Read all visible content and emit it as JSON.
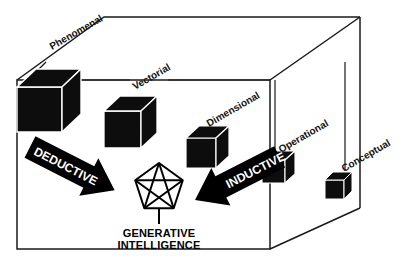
{
  "diagram": {
    "title_visible": false,
    "background_color": "#ffffff",
    "line_color": "#1a1a1a",
    "cube_fill": "#0d0d0d",
    "arrow_fill": "#000000",
    "arrow_text_color": "#ffffff",
    "axis_labels": [
      {
        "id": "phenomenal",
        "text": "Phenomenal",
        "x": 52,
        "y": 50,
        "rotation": -30,
        "font_size": 10
      },
      {
        "id": "vectorial",
        "text": "Vectorial",
        "x": 135,
        "y": 90,
        "rotation": -30,
        "font_size": 10
      },
      {
        "id": "dimensional",
        "text": "Dimensional",
        "x": 209,
        "y": 127,
        "rotation": -30,
        "font_size": 10
      },
      {
        "id": "operational",
        "text": "Operational",
        "x": 278,
        "y": 152,
        "rotation": -30,
        "font_size": 10
      },
      {
        "id": "conceptual",
        "text": "Conceptual",
        "x": 340,
        "y": 170,
        "rotation": -30,
        "font_size": 10
      }
    ],
    "cubes": [
      {
        "id": "cube-phenomenal",
        "label_ref": "phenomenal",
        "x": 17,
        "y": 69,
        "size": 52
      },
      {
        "id": "cube-vectorial",
        "label_ref": "vectorial",
        "x": 104,
        "y": 96,
        "size": 43
      },
      {
        "id": "cube-dimensional",
        "label_ref": "dimensional",
        "x": 186,
        "y": 126,
        "size": 34
      },
      {
        "id": "cube-operational",
        "label_ref": "operational",
        "x": 262,
        "y": 151,
        "size": 27
      },
      {
        "id": "cube-conceptual",
        "label_ref": "conceptual",
        "x": 325,
        "y": 172,
        "size": 22
      }
    ],
    "arrows": [
      {
        "id": "deductive",
        "text": "DEDUCTIVE",
        "direction": "down-right",
        "angle": 27,
        "font_size": 12
      },
      {
        "id": "inductive",
        "text": "INDUCTIVE",
        "direction": "up-left",
        "angle": -27,
        "font_size": 12
      }
    ],
    "center_node": {
      "id": "generative-intelligence",
      "symbol": "pentagram",
      "cx": 159,
      "cy": 188,
      "radius": 25,
      "caption_line_1": "GENERATIVE",
      "caption_line_2": "INTELLIGENCE"
    }
  }
}
